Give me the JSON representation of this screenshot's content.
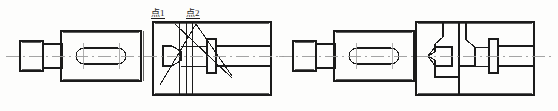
{
  "drawing": {
    "title": "Mechanical Shaft Assembly Sectional Views",
    "type": "engineering-line-drawing",
    "canvas": {
      "width": 558,
      "height": 111,
      "background": "#fdfdfc"
    },
    "stroke": {
      "outline_color": "#1b1b1b",
      "centerline_color": "#9a9a9a",
      "outline_width": 1.1,
      "thin_width": 0.8
    },
    "annotations": [
      {
        "id": "point1",
        "text": "点1",
        "x": 151,
        "y": 8,
        "underline": true
      },
      {
        "id": "point2",
        "text": "点2",
        "x": 186,
        "y": 8,
        "underline": true
      }
    ],
    "views": [
      {
        "id": "left-view",
        "name": "left-assembly-view",
        "description": "Shaft with keyway slot entering a sectioned housing block with cross-hatched diagonal indicator lines and measurement points",
        "centerline_y": 56,
        "parts": [
          {
            "name": "end-cap-cylinder",
            "x": 20,
            "y": 41,
            "w": 23,
            "h": 30
          },
          {
            "name": "stepped-shaft-body",
            "x": 43,
            "y": 31,
            "w": 23,
            "h": 50
          },
          {
            "name": "main-shaft-block",
            "x": 61,
            "y": 31,
            "w": 80,
            "h": 50
          },
          {
            "name": "keyway-oval-slot",
            "cx": 101,
            "cy": 56,
            "rx": 25,
            "ry": 8
          },
          {
            "name": "housing-block",
            "x": 153,
            "y": 22,
            "w": 118,
            "h": 73
          },
          {
            "name": "cone-taper",
            "x": 163,
            "y": 47,
            "w": 18,
            "h": 19
          },
          {
            "name": "flange-plate",
            "x": 207,
            "y": 39,
            "w": 9,
            "h": 34
          },
          {
            "name": "output-shaft",
            "x": 216,
            "y": 46,
            "w": 55,
            "h": 21
          }
        ]
      },
      {
        "id": "right-view",
        "name": "right-assembly-view",
        "description": "Same shaft assembly shown with housing V-notch internal profile without measurement point callouts",
        "centerline_y": 56,
        "parts": [
          {
            "name": "end-cap-cylinder",
            "x": 293,
            "y": 41,
            "w": 23,
            "h": 30
          },
          {
            "name": "stepped-shaft-body",
            "x": 316,
            "y": 31,
            "w": 23,
            "h": 50
          },
          {
            "name": "main-shaft-block",
            "x": 334,
            "y": 31,
            "w": 80,
            "h": 50
          },
          {
            "name": "keyway-oval-slot",
            "cx": 374,
            "cy": 56,
            "rx": 25,
            "ry": 8
          },
          {
            "name": "housing-block",
            "x": 416,
            "y": 22,
            "w": 118,
            "h": 73
          },
          {
            "name": "v-notch-cone",
            "x": 426,
            "y": 47,
            "w": 18,
            "h": 19
          },
          {
            "name": "flange-plate",
            "x": 470,
            "y": 39,
            "w": 9,
            "h": 34
          },
          {
            "name": "output-shaft",
            "x": 479,
            "y": 46,
            "w": 55,
            "h": 21
          }
        ]
      }
    ]
  }
}
